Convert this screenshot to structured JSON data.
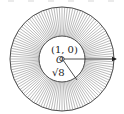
{
  "diagram": {
    "center_label": "(1, 0)",
    "origin_label": "O",
    "inner_radius_label": "√8",
    "colors": {
      "stroke": "#333333",
      "hatch": "#555555",
      "background": "#ffffff"
    },
    "outer_circle": {
      "cx": 62,
      "cy": 59,
      "r": 52
    },
    "inner_circle": {
      "cx": 62,
      "cy": 59,
      "r": 23
    },
    "hatch_count": 120
  }
}
